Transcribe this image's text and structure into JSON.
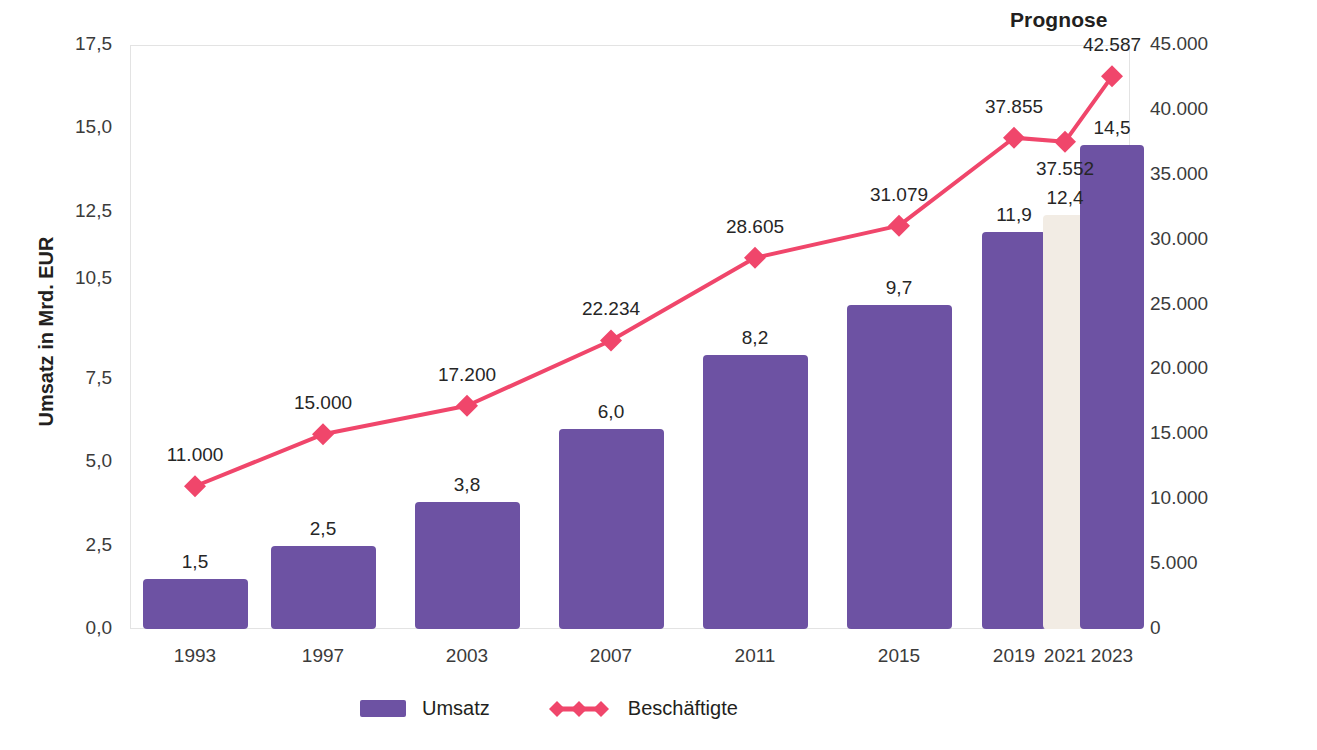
{
  "annotations": {
    "prognose_label": "Prognose"
  },
  "axes": {
    "left": {
      "title": "Umsatz in Mrd. EUR",
      "ticks": [
        "0,0",
        "2,5",
        "5,0",
        "7,5",
        "10,5",
        "12,5",
        "15,0",
        "17,5"
      ],
      "min": 0,
      "max": 17.5
    },
    "right": {
      "title": "Beschäftigte in Personen",
      "ticks": [
        "0",
        "5.000",
        "10.000",
        "15.000",
        "20.000",
        "25.000",
        "30.000",
        "35.000",
        "40.000",
        "45.000"
      ],
      "min": 0,
      "max": 45000
    },
    "x": {
      "ticks": [
        "1993",
        "1997",
        "2003",
        "2007",
        "2011",
        "2015",
        "2019",
        "2021",
        "2023"
      ]
    }
  },
  "legend": {
    "items": [
      {
        "label": "Umsatz",
        "type": "bar",
        "color": "#6d52a3"
      },
      {
        "label": "Beschäftigte",
        "type": "line",
        "color": "#f0466b"
      }
    ]
  },
  "colors": {
    "bar_actual": "#6d52a3",
    "bar_forecast": "#f2ece4",
    "line": "#f0466b",
    "marker": "#f0466b",
    "frame": "#e3e3e3",
    "text": "#231f20"
  },
  "chart_data": {
    "type": "bar",
    "title": "",
    "subtitle": "",
    "xlabel": "",
    "ylabel": "Umsatz in Mrd. EUR",
    "y2label": "Beschäftigte in Personen",
    "categories": [
      "1993",
      "1997",
      "2003",
      "2007",
      "2011",
      "2015",
      "2019",
      "2021",
      "2023"
    ],
    "ylim": [
      0,
      17.5
    ],
    "y2lim": [
      0,
      45000
    ],
    "grid": false,
    "legend_position": "bottom",
    "annotations": [
      "Prognose"
    ],
    "series": [
      {
        "name": "Umsatz",
        "type": "bar",
        "axis": "left",
        "unit": "Mrd. EUR",
        "values": [
          1.5,
          2.5,
          3.8,
          6.0,
          8.2,
          9.7,
          11.9,
          12.4,
          14.5
        ],
        "value_labels": [
          "1,5",
          "2,5",
          "3,8",
          "6,0",
          "8,2",
          "9,7",
          "11,9",
          "12,4",
          "14,5"
        ],
        "forecast_flags": [
          false,
          false,
          false,
          false,
          false,
          false,
          false,
          true,
          false
        ]
      },
      {
        "name": "Beschäftigte",
        "type": "line",
        "axis": "right",
        "unit": "Personen",
        "values": [
          11000,
          15000,
          17200,
          22234,
          28605,
          31079,
          37855,
          37552,
          42587
        ],
        "value_labels": [
          "11.000",
          "15.000",
          "17.200",
          "22.234",
          "28.605",
          "31.079",
          "37.855",
          "37.552",
          "42.587"
        ]
      }
    ]
  }
}
